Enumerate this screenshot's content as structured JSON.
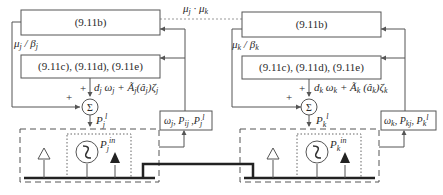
{
  "diagram": {
    "communication_label": "μj , μk",
    "agents": [
      {
        "id": "j",
        "box_top_label": "(9.11b)",
        "box_mid_label": "(9.11c), (9.11d), (9.11e)",
        "feedback_label": "μj / βj",
        "signal_label": "dj ωj + Ãj(âj)ζj",
        "sum_symbol": "Σ",
        "sum_output_label": "Pjl",
        "generator_label": "Pjin",
        "measure_box_label": "ωj, Pij, Pjl",
        "plus_top": "+",
        "plus_left": "+"
      },
      {
        "id": "k",
        "box_top_label": "(9.11b)",
        "box_mid_label": "(9.11c), (9.11d), (9.11e)",
        "feedback_label": "μk / βk",
        "signal_label": "dk ωk + Ãk (âk)ζk",
        "sum_symbol": "Σ",
        "sum_output_label": "Pkl",
        "generator_label": "Pkin",
        "measure_box_label": "ωk, Pkj, Pkl",
        "plus_top": "+",
        "plus_left": "+"
      }
    ],
    "colors": {
      "line": "#555555",
      "bus": "#222222",
      "background": "#ffffff"
    }
  }
}
